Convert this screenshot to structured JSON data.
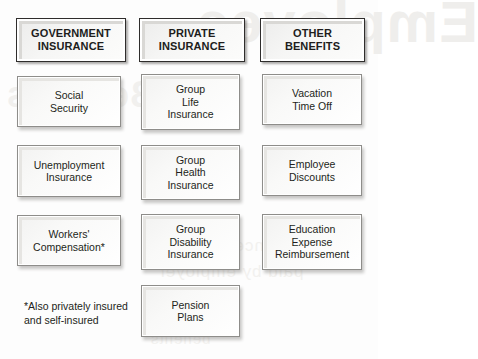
{
  "diagram": {
    "title": "Employee Benefits",
    "columns": [
      {
        "header": "GOVERNMENT\nINSURANCE",
        "header_name": "government-insurance",
        "items": [
          {
            "label": "Social\nSecurity",
            "name": "social-security"
          },
          {
            "label": "Unemployment\nInsurance",
            "name": "unemployment-insurance"
          },
          {
            "label": "Workers'\nCompensation*",
            "name": "workers-compensation"
          }
        ]
      },
      {
        "header": "PRIVATE\nINSURANCE",
        "header_name": "private-insurance",
        "items": [
          {
            "label": "Group\nLife\nInsurance",
            "name": "group-life-insurance"
          },
          {
            "label": "Group\nHealth\nInsurance",
            "name": "group-health-insurance"
          },
          {
            "label": "Group\nDisability\nInsurance",
            "name": "group-disability-insurance"
          },
          {
            "label": "Pension\nPlans",
            "name": "pension-plans"
          }
        ]
      },
      {
        "header": "OTHER\nBENEFITS",
        "header_name": "other-benefits",
        "items": [
          {
            "label": "Vacation\nTime Off",
            "name": "vacation-time-off"
          },
          {
            "label": "Employee\nDiscounts",
            "name": "employee-discounts"
          },
          {
            "label": "Education\nExpense\nReimbursement",
            "name": "education-expense-reimbursement"
          }
        ]
      }
    ],
    "footnote": "*Also privately insured\nand self-insured",
    "watermarks": [
      {
        "text": "Employee",
        "name": "watermark-top"
      },
      {
        "text": "Benefits",
        "name": "watermark-left"
      },
      {
        "text": "insurance coverage",
        "name": "watermark-mid-1"
      },
      {
        "text": "paid by employer",
        "name": "watermark-mid-2"
      },
      {
        "text": "benefits",
        "name": "watermark-bottom"
      }
    ],
    "colors": {
      "text": "#231f20",
      "header_border": "#2f2d2c",
      "item_border": "#8e8d8a",
      "box_fill": "#fbfbfa",
      "background": "#fdfdfd",
      "watermark": "#efeeec"
    }
  }
}
